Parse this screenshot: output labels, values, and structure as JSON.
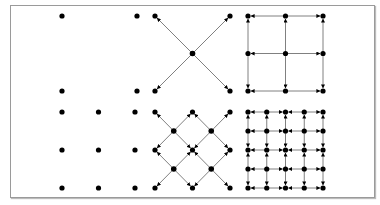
{
  "diagram": {
    "colors": {
      "node": "#000000",
      "edge": "#808080",
      "frame": "#9a9a9a"
    },
    "panels": [
      {
        "id": "coarse-nodes",
        "description": "2x2 nodes, no edges",
        "nodes": [
          [
            0,
            0
          ],
          [
            1,
            0
          ],
          [
            0,
            1
          ],
          [
            1,
            1
          ]
        ],
        "grid": [
          2,
          2
        ],
        "edges": []
      },
      {
        "id": "coarse-diagonal",
        "description": "4 corner nodes connected via center node (X shape)",
        "nodes": [
          [
            0,
            0
          ],
          [
            1,
            0
          ],
          [
            0,
            1
          ],
          [
            1,
            1
          ],
          [
            0.5,
            0.5
          ]
        ],
        "grid": [
          2,
          2
        ],
        "edges": [
          [
            4,
            0
          ],
          [
            4,
            1
          ],
          [
            4,
            2
          ],
          [
            4,
            3
          ]
        ],
        "arrows": "to-corners"
      },
      {
        "id": "coarse-orthogonal",
        "description": "3x3 nodes with orthogonal edges",
        "grid": [
          3,
          3
        ],
        "edges": "orthogonal"
      },
      {
        "id": "fine-nodes",
        "description": "3x3 nodes, no edges",
        "grid": [
          3,
          3
        ],
        "edges": []
      },
      {
        "id": "fine-diagonal",
        "description": "diamond lattice with 13 nodes",
        "grid": [
          5,
          5
        ],
        "edges": "diagonal"
      },
      {
        "id": "fine-orthogonal",
        "description": "5x5 nodes with orthogonal edges",
        "grid": [
          5,
          5
        ],
        "edges": "orthogonal"
      }
    ]
  }
}
